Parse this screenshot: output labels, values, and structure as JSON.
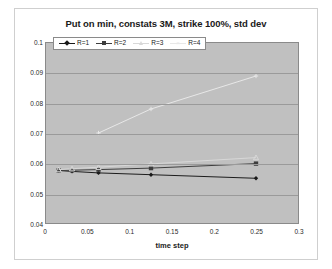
{
  "chart_data": {
    "type": "line",
    "title": "Put on min, constats 3M, strike 100%, std dev",
    "xlabel": "time step",
    "ylabel": "",
    "xlim": [
      0,
      0.3
    ],
    "ylim": [
      0.04,
      0.1
    ],
    "xticks": [
      "0",
      "0.05",
      "0.1",
      "0.15",
      "0.2",
      "0.25",
      "0.3"
    ],
    "xtick_values": [
      0,
      0.05,
      0.1,
      0.15,
      0.2,
      0.25,
      0.3
    ],
    "yticks": [
      "0.04",
      "0.05",
      "0.06",
      "0.07",
      "0.08",
      "0.09",
      "0.1"
    ],
    "ytick_values": [
      0.04,
      0.05,
      0.06,
      0.07,
      0.08,
      0.09,
      0.1
    ],
    "grid": true,
    "legend_position": "top-left-inside",
    "plot_background": "#c0c0c0",
    "series": [
      {
        "name": "R=1",
        "color": "#1a1a1a",
        "marker": "diamond",
        "x": [
          0.015,
          0.031,
          0.0625,
          0.125,
          0.25
        ],
        "values": [
          0.0575,
          0.0572,
          0.0567,
          0.0561,
          0.0549
        ]
      },
      {
        "name": "R=2",
        "color": "#3d3d3d",
        "marker": "square",
        "x": [
          0.015,
          0.031,
          0.0625,
          0.125,
          0.25
        ],
        "values": [
          0.0575,
          0.0576,
          0.0578,
          0.0583,
          0.0598
        ]
      },
      {
        "name": "R=3",
        "color": "#d8d8d8",
        "marker": "triangle",
        "x": [
          0.015,
          0.031,
          0.0625,
          0.125,
          0.25
        ],
        "values": [
          0.0578,
          0.0581,
          0.0586,
          0.0597,
          0.0618
        ]
      },
      {
        "name": "R=4",
        "color": "#e8e8e8",
        "marker": "cross",
        "x": [
          0.0625,
          0.125,
          0.25
        ],
        "values": [
          0.07,
          0.078,
          0.089
        ]
      }
    ]
  }
}
